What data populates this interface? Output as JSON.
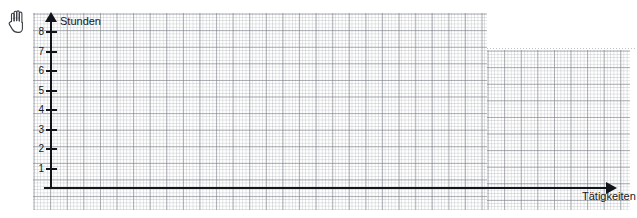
{
  "chart_data": {
    "type": "line",
    "title": "",
    "subtitle": "",
    "xlabel": "Tätigkeiten",
    "ylabel": "Stunden",
    "grid": true,
    "legend": "none",
    "series": [],
    "categories": [],
    "values": [],
    "x": [],
    "xlim": [
      0,
      0
    ],
    "ylim": [
      0,
      8
    ],
    "y_ticks": [
      1,
      2,
      3,
      4,
      5,
      6,
      7,
      8
    ],
    "y_tick_labels": [
      "1",
      "2",
      "3",
      "4",
      "5",
      "6",
      "7",
      "8"
    ],
    "x_ticks": [],
    "x_tick_labels": []
  },
  "axes": {
    "y": {
      "title": "Stunden",
      "arrow": "up-arrow-icon",
      "ticks": [
        {
          "value": 8,
          "label": "8"
        },
        {
          "value": 7,
          "label": "7"
        },
        {
          "value": 6,
          "label": "6"
        },
        {
          "value": 5,
          "label": "5"
        },
        {
          "value": 4,
          "label": "4"
        },
        {
          "value": 3,
          "label": "3"
        },
        {
          "value": 2,
          "label": "2"
        },
        {
          "value": 1,
          "label": "1"
        }
      ]
    },
    "x": {
      "title": "Tätigkeiten",
      "arrow": "right-arrow-icon",
      "ticks": []
    }
  },
  "annotations": {
    "hand": {
      "icon": "hand-icon",
      "label": ""
    }
  },
  "colors": {
    "axis": "#111418",
    "grid_minor": "#969aa2",
    "grid_major": "#787c84",
    "paper": "#ffffff",
    "text": "#16181c"
  }
}
